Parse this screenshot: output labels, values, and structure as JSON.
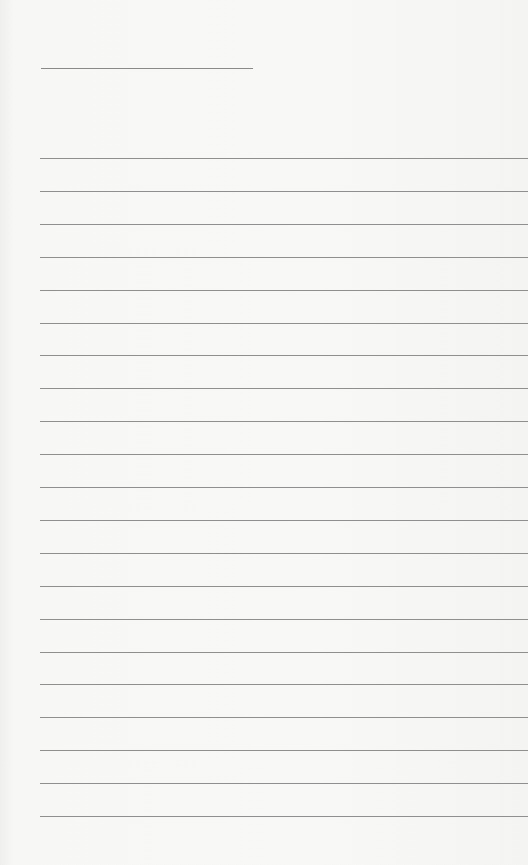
{
  "page": {
    "type": "lined-notepad-sheet",
    "background_color": "#f7f7f6",
    "line_color": "#8f8f8f",
    "header_line": {
      "x": 41,
      "y": 68,
      "width": 212
    },
    "ruled_lines": {
      "count": 21,
      "start_y": 158,
      "spacing": 32.9,
      "start_x": 40
    },
    "text": ""
  }
}
